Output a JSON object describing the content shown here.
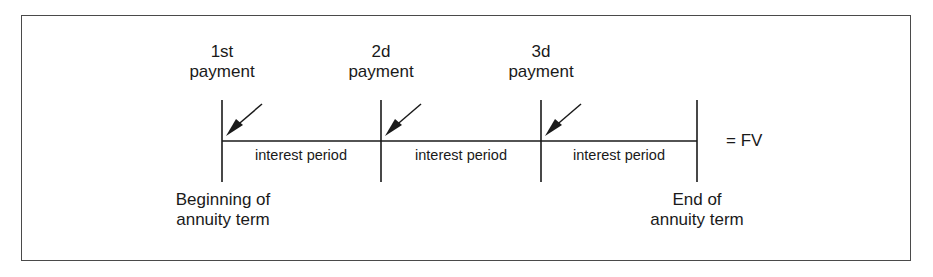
{
  "figure": {
    "frame": {
      "x": 21,
      "y": 15,
      "width": 890,
      "height": 246,
      "border_color": "#4a4a4a"
    },
    "background_color": "#ffffff",
    "line_color": "#1a1a1a"
  },
  "timeline": {
    "axis_y": 141,
    "tick_top": 100,
    "tick_bottom": 182,
    "tick_positions": [
      222,
      381,
      541,
      697
    ],
    "line_start_x": 222,
    "line_end_x": 697
  },
  "payments": [
    {
      "number_label": "1st",
      "word_label": "payment",
      "x": 222,
      "label_top": 42,
      "arrow": {
        "tail_x": 262,
        "tail_y": 104,
        "head_x": 228,
        "head_y": 134
      }
    },
    {
      "number_label": "2d",
      "word_label": "payment",
      "x": 381,
      "label_top": 42,
      "arrow": {
        "tail_x": 421,
        "tail_y": 104,
        "head_x": 387,
        "head_y": 134
      }
    },
    {
      "number_label": "3d",
      "word_label": "payment",
      "x": 541,
      "label_top": 42,
      "arrow": {
        "tail_x": 581,
        "tail_y": 104,
        "head_x": 547,
        "head_y": 134
      }
    }
  ],
  "interest_periods": [
    {
      "label": "interest period",
      "center_x": 301,
      "y": 147
    },
    {
      "label": "interest period",
      "center_x": 461,
      "y": 147
    },
    {
      "label": "interest period",
      "center_x": 619,
      "y": 147
    }
  ],
  "term_markers": {
    "start": {
      "line1": "Beginning of",
      "line2": "annuity term",
      "center_x": 223,
      "top": 190
    },
    "end": {
      "line1": "End of",
      "line2": "annuity term",
      "center_x": 697,
      "top": 190
    }
  },
  "future_value": {
    "label": "= FV",
    "x": 726,
    "y": 131
  }
}
